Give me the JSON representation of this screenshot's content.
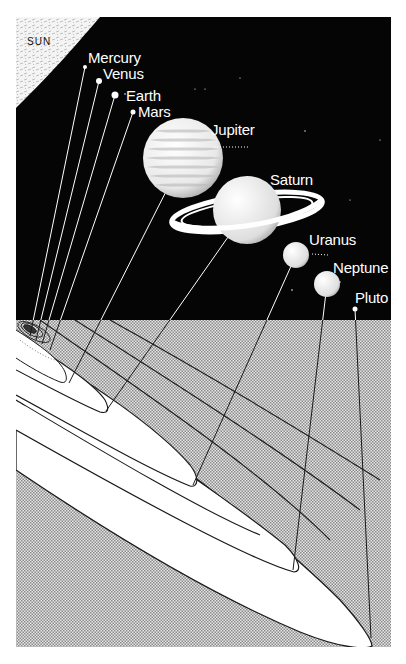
{
  "diagram": {
    "sun_label": "SUN",
    "colors": {
      "space": "#050505",
      "sun": "#f2f2f2",
      "orbit_plane_shade": "#c9c9c9",
      "orbit_band": "#ffffff",
      "orbit_line": "#1a1a1a",
      "label": "#ffffff"
    },
    "planets": [
      {
        "name": "Mercury",
        "label_x": 88,
        "label_y": 50,
        "dot_x": 85,
        "dot_y": 67,
        "r": 2,
        "orbit_x": 30,
        "orbit_y": 336
      },
      {
        "name": "Venus",
        "label_x": 103,
        "label_y": 66,
        "dot_x": 99,
        "dot_y": 81,
        "r": 3,
        "orbit_x": 36,
        "orbit_y": 340
      },
      {
        "name": "Earth",
        "label_x": 126,
        "label_y": 88,
        "dot_x": 115,
        "dot_y": 95,
        "r": 3.5,
        "orbit_x": 42,
        "orbit_y": 344
      },
      {
        "name": "Mars",
        "label_x": 138,
        "label_y": 104,
        "dot_x": 133,
        "dot_y": 112,
        "r": 2.5,
        "orbit_x": 50,
        "orbit_y": 350
      },
      {
        "name": "Jupiter",
        "label_x": 211,
        "label_y": 122,
        "dot_x": 183,
        "dot_y": 158,
        "r": 40,
        "orbit_x": 69,
        "orbit_y": 383
      },
      {
        "name": "Saturn",
        "label_x": 270,
        "label_y": 172,
        "dot_x": 247,
        "dot_y": 210,
        "r": 34,
        "orbit_x": 106,
        "orbit_y": 411
      },
      {
        "name": "Uranus",
        "label_x": 309,
        "label_y": 232,
        "dot_x": 296,
        "dot_y": 255,
        "r": 13,
        "orbit_x": 193,
        "orbit_y": 485
      },
      {
        "name": "Neptune",
        "label_x": 333,
        "label_y": 260,
        "dot_x": 327,
        "dot_y": 284,
        "r": 13,
        "orbit_x": 293,
        "orbit_y": 570
      },
      {
        "name": "Pluto",
        "label_x": 355,
        "label_y": 290,
        "dot_x": 355,
        "dot_y": 309,
        "r": 2.5,
        "orbit_x": 371,
        "orbit_y": 638
      }
    ]
  }
}
